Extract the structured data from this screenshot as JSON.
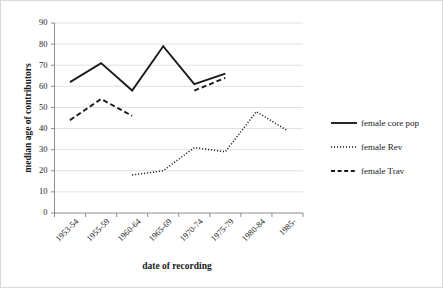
{
  "chart_data": {
    "type": "line",
    "title": "",
    "xlabel": "date of recording",
    "ylabel": "median age of contributors",
    "categories": [
      "1953-54",
      "1955-59",
      "1960-64",
      "1965-69",
      "1970-74",
      "1975-79",
      "1980-84",
      "1985-"
    ],
    "ylim": [
      0,
      90
    ],
    "yticks": [
      0,
      10,
      20,
      30,
      40,
      50,
      60,
      70,
      80,
      90
    ],
    "grid": true,
    "legend_position": "right",
    "series": [
      {
        "name": "female core pop",
        "style": "solid",
        "color": "#1a1a1a",
        "values": [
          62,
          71,
          58,
          79,
          61,
          66,
          null,
          null
        ]
      },
      {
        "name": "female Rev",
        "style": "dotted",
        "color": "#1a1a1a",
        "values": [
          null,
          null,
          18,
          20,
          31,
          29,
          48,
          39
        ]
      },
      {
        "name": "female Trav",
        "style": "dashed",
        "color": "#1a1a1a",
        "values": [
          44,
          54,
          46,
          null,
          58,
          64,
          null,
          null
        ]
      }
    ]
  },
  "legend": {
    "items": [
      {
        "label": "female core pop",
        "style": "solid"
      },
      {
        "label": "female Rev",
        "style": "dotted"
      },
      {
        "label": "female Trav",
        "style": "dashed"
      }
    ]
  },
  "axes": {
    "y_title": "median age of contributors",
    "x_title": "date of recording"
  }
}
